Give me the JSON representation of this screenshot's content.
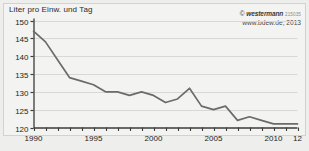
{
  "figure": {
    "title": "Liter pro Einw. und Tag",
    "credit_symbol": "©",
    "credit_brand": "westermann",
    "credit_code": "215035",
    "source": "www.bdew.de, 2013",
    "background_color": "#eeeeec",
    "plot_background_color": "#f3f3f1",
    "line_color": "#6b6b68",
    "grid_color": "#d8d8d5",
    "axis_color": "#3c3c3a"
  },
  "chart_data": {
    "type": "line",
    "title": "Liter pro Einw. und Tag",
    "xlabel": "",
    "ylabel": "Liter pro Einw. und Tag",
    "x": [
      1990,
      1991,
      1992,
      1993,
      1994,
      1995,
      1996,
      1997,
      1998,
      1999,
      2000,
      2001,
      2002,
      2003,
      2004,
      2005,
      2006,
      2007,
      2008,
      2009,
      2010,
      2011,
      2012
    ],
    "values": [
      147,
      144,
      139,
      134,
      133,
      132,
      130,
      130,
      129,
      130,
      129,
      127,
      128,
      131,
      126,
      125,
      126,
      122,
      123,
      122,
      121,
      121,
      121
    ],
    "series": [
      {
        "name": "Wasserverbrauch",
        "values": [
          147,
          144,
          139,
          134,
          133,
          132,
          130,
          130,
          129,
          130,
          129,
          127,
          128,
          131,
          126,
          125,
          126,
          122,
          123,
          122,
          121,
          121,
          121
        ]
      }
    ],
    "xlim": [
      1990,
      2012
    ],
    "ylim": [
      120,
      150
    ],
    "yticks": [
      120,
      125,
      130,
      135,
      140,
      145,
      150
    ],
    "ytick_labels": [
      "120",
      "125",
      "130",
      "135",
      "140",
      "145",
      "150"
    ],
    "xticks": [
      1990,
      1995,
      2000,
      2005,
      2010,
      2012
    ],
    "xtick_labels": [
      "1990",
      "1995",
      "2000",
      "2005",
      "2010",
      "12"
    ],
    "grid": true,
    "grid_axis": "y",
    "legend": false,
    "legend_position": "none"
  }
}
